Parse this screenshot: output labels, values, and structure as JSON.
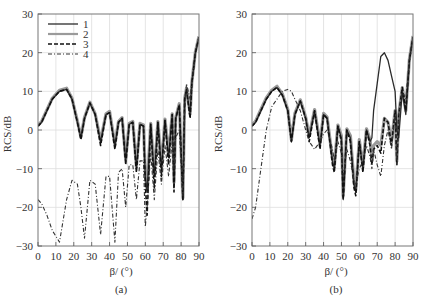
{
  "figure": {
    "panels": [
      {
        "id": "a",
        "caption": "(a)",
        "ylabel": "RCS/dB",
        "xlabel": "β/ (°)"
      },
      {
        "id": "b",
        "caption": "(b)",
        "ylabel": "RCS/dB",
        "xlabel": "β/ (°)"
      }
    ],
    "legend": [
      {
        "label": "1",
        "style": "solid",
        "color": "#333333"
      },
      {
        "label": "2",
        "style": "solid-gray",
        "color": "#888888"
      },
      {
        "label": "3",
        "style": "dashed",
        "color": "#111111"
      },
      {
        "label": "4",
        "style": "dash-dot",
        "color": "#333333"
      }
    ],
    "xticks": [
      "0",
      "10",
      "20",
      "30",
      "40",
      "50",
      "60",
      "70",
      "80",
      "90"
    ],
    "yticks": [
      "30",
      "20",
      "10",
      "0",
      "−10",
      "−20",
      "−30"
    ]
  },
  "chart_data": [
    {
      "type": "line",
      "title": "(a)",
      "xlabel": "β/ (°)",
      "ylabel": "RCS/dB",
      "xlim": [
        0,
        90
      ],
      "ylim": [
        -30,
        30
      ],
      "grid": true,
      "legend_position": "upper left",
      "x": [
        0,
        2,
        5,
        8,
        12,
        16,
        19,
        22,
        24,
        26,
        29,
        32,
        35,
        38,
        40,
        43,
        45,
        47,
        49,
        51,
        53,
        55,
        57,
        59,
        60,
        61,
        63,
        65,
        67,
        69,
        71,
        73,
        75,
        76,
        77,
        79,
        81,
        82,
        83,
        85,
        86,
        88,
        90
      ],
      "series": [
        {
          "name": "1",
          "values": [
            1,
            2,
            5,
            8,
            10,
            10.5,
            8,
            2,
            -2,
            3,
            7,
            4,
            -3,
            4,
            4.5,
            -4,
            2,
            3,
            -8,
            1.5,
            2,
            -10,
            1.5,
            1,
            -12,
            -16,
            1.5,
            -12,
            2,
            -10,
            2.5,
            -7,
            4,
            -14,
            3,
            6.5,
            -18,
            8,
            10.5,
            4,
            12,
            20,
            24
          ]
        },
        {
          "name": "2",
          "values": [
            1.2,
            2.2,
            5.2,
            8.2,
            10.3,
            10.8,
            8.2,
            2.3,
            -1.8,
            3.2,
            7.2,
            4.2,
            -2.8,
            4.2,
            4.8,
            -3.8,
            2.2,
            3.2,
            -7.5,
            1.7,
            2.2,
            -9.5,
            1.7,
            1.3,
            -11.5,
            -15.5,
            1.7,
            -11.5,
            2.2,
            -9.5,
            2.8,
            -6.5,
            4.2,
            -13.5,
            3.2,
            6.8,
            -17.5,
            8.2,
            10.8,
            4.2,
            12.2,
            20.2,
            24.2
          ]
        },
        {
          "name": "3",
          "values": [
            1,
            2,
            5,
            8,
            10,
            10.5,
            8,
            2,
            -2.5,
            3,
            7,
            4,
            -4,
            4,
            4.5,
            -5,
            2,
            3,
            -9,
            1.5,
            2,
            -11,
            1.5,
            1,
            -14,
            -22,
            1.5,
            -15,
            2,
            -12,
            2.5,
            -9,
            4,
            -16,
            3,
            6.5,
            -18,
            8,
            10.5,
            3,
            12,
            20,
            24
          ]
        },
        {
          "name": "4",
          "values": [
            -18,
            -19,
            -22,
            -26,
            -29,
            -18,
            -13,
            -14,
            -20,
            -28,
            -13,
            -14,
            -27,
            -12,
            -12,
            -29,
            -11,
            -10,
            -20,
            -9,
            -9,
            -18,
            -8,
            -8,
            -25,
            -20,
            -6,
            -18,
            -5,
            -14,
            -4,
            -12,
            -3,
            -10,
            -2,
            0,
            -17,
            5,
            12,
            8,
            12,
            20,
            24
          ]
        }
      ]
    },
    {
      "type": "line",
      "title": "(b)",
      "xlabel": "β/ (°)",
      "ylabel": "RCS/dB",
      "xlim": [
        0,
        90
      ],
      "ylim": [
        -30,
        30
      ],
      "grid": true,
      "legend_position": "none",
      "x": [
        0,
        2,
        5,
        8,
        11,
        14,
        17,
        20,
        22,
        24,
        27,
        30,
        32,
        35,
        38,
        40,
        42,
        45,
        46,
        48,
        50,
        51,
        53,
        55,
        57,
        58,
        60,
        62,
        64,
        66,
        67,
        68,
        70,
        72,
        74,
        76,
        78,
        80,
        81,
        82,
        84,
        86,
        88,
        90
      ],
      "series": [
        {
          "name": "1",
          "values": [
            1,
            2,
            5,
            8,
            10,
            11,
            9,
            5,
            -3,
            4,
            7.5,
            3,
            -2,
            5,
            -4,
            4,
            3,
            -8,
            -10,
            1,
            -2,
            -18,
            0,
            -2,
            -14,
            -16,
            -3,
            -10,
            0,
            -3,
            -2,
            5,
            12,
            19,
            20,
            18,
            14,
            10,
            0,
            -2,
            10,
            4,
            18,
            24
          ]
        },
        {
          "name": "2",
          "values": [
            1.3,
            2.3,
            5.3,
            8.3,
            10.3,
            11.3,
            9.3,
            5.3,
            -2.5,
            4.3,
            7.8,
            3.3,
            -1.5,
            5.3,
            -3.5,
            4.3,
            3.3,
            -7.5,
            -9.5,
            1.3,
            -1.5,
            -17,
            0.3,
            -1.5,
            -13.5,
            -15.5,
            -2.5,
            -9.5,
            0.3,
            -2.5,
            -8,
            -4,
            -3,
            -4,
            3,
            2,
            -3,
            5,
            -8,
            4,
            11,
            5,
            18.3,
            24.3
          ]
        },
        {
          "name": "3",
          "values": [
            1,
            2,
            5,
            8,
            10,
            11,
            9,
            5,
            -3,
            4,
            7.5,
            3,
            -3,
            5,
            -5,
            4,
            3,
            -9,
            -11,
            1,
            -3,
            -18,
            0,
            -3,
            -15,
            -17,
            -3,
            -11,
            0,
            -4,
            -9,
            -5,
            -4,
            -6,
            3,
            2,
            -4,
            5,
            -9,
            4,
            11,
            5,
            18,
            24
          ]
        },
        {
          "name": "4",
          "values": [
            -23,
            -20,
            -10,
            0,
            6,
            8,
            10,
            10.5,
            10,
            8,
            5,
            0,
            -3,
            -5,
            -3,
            -1,
            0,
            -5,
            -8,
            -3,
            -6,
            -12,
            -5,
            -8,
            -13,
            -14,
            -10,
            -8,
            -4,
            -7,
            -10,
            -5,
            -9,
            -12,
            -4,
            0,
            -5,
            4,
            -8,
            4,
            10,
            8,
            18,
            24
          ]
        }
      ]
    }
  ]
}
